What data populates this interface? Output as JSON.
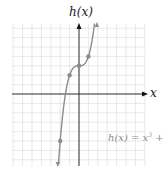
{
  "chart_data": {
    "type": "line",
    "title": "",
    "xlabel": "x",
    "ylabel": "h(x)",
    "equation_label": "h(x) = x³ + 3",
    "equation_parts": {
      "lhs": "h(x) = x",
      "exp": "3",
      "rhs": " + 3"
    },
    "grid": true,
    "xlim": [
      -7,
      7
    ],
    "ylim": [
      -7,
      7
    ],
    "points": [
      {
        "x": -2,
        "y": -5
      },
      {
        "x": -1,
        "y": 2
      },
      {
        "x": 0,
        "y": 3
      },
      {
        "x": 1,
        "y": 4
      },
      {
        "x": 2,
        "y": 11
      }
    ],
    "series": [
      {
        "name": "h(x) = x^3 + 3",
        "function": "x^3 + 3",
        "x_range": [
          -2.25,
          1.9
        ]
      }
    ],
    "colors": {
      "curve": "#8c8c8c",
      "axes": "#333333",
      "grid": "#e2e2e2",
      "points": "#8c8c8c"
    }
  }
}
